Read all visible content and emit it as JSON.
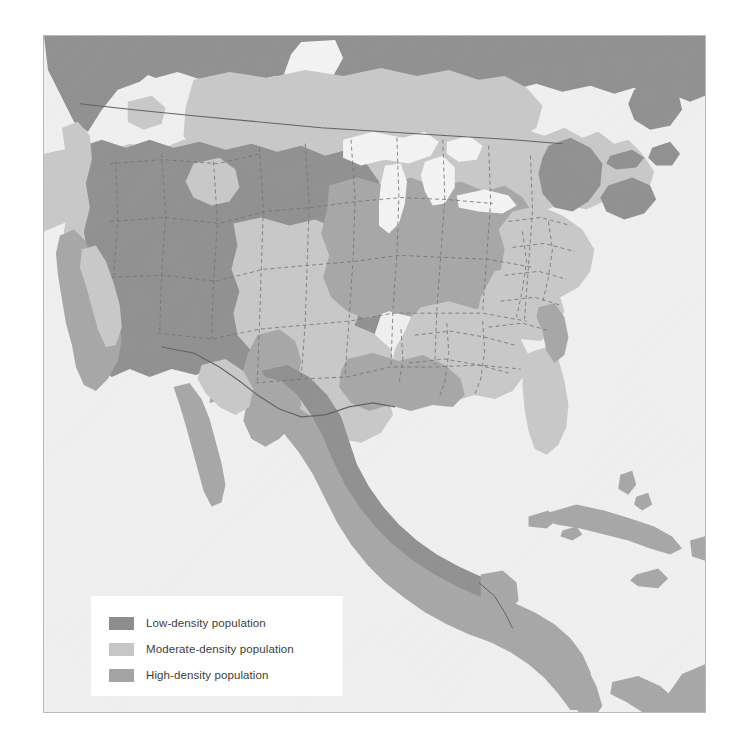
{
  "figure": {
    "kind": "choropleth-map",
    "region": "North America",
    "frame_background": "#eeeeee",
    "frame_border_color": "#b9b9b9",
    "page_background": "#ffffff"
  },
  "legend": {
    "background": "#ffffff",
    "items": [
      {
        "swatch_name": "swatch-low-density",
        "label": "Low-density population",
        "color": "#8d8d8d"
      },
      {
        "swatch_name": "swatch-moderate-density",
        "label": "Moderate-density population",
        "color": "#c6c6c6"
      },
      {
        "swatch_name": "swatch-high-density",
        "label": "High-density population",
        "color": "#a4a4a4"
      }
    ]
  },
  "map": {
    "ocean_color": "#eeeeee",
    "land_classes": {
      "low": "#8d8d8d",
      "moderate": "#c6c6c6",
      "high": "#a4a4a4",
      "water_inland": "#f2f2f2"
    },
    "boundary_styles": {
      "state_border_color": "#6f6f6f",
      "state_border_dash": "4,3",
      "national_border_color": "#5d5d5d"
    },
    "features": [
      {
        "name": "canada-north-boreal",
        "class": "low"
      },
      {
        "name": "canada-prairies",
        "class": "moderate"
      },
      {
        "name": "pacific-northwest",
        "class": "low"
      },
      {
        "name": "mountain-west",
        "class": "low"
      },
      {
        "name": "great-plains",
        "class": "moderate"
      },
      {
        "name": "midwest-great-lakes",
        "class": "high"
      },
      {
        "name": "northeast-corridor",
        "class": "moderate"
      },
      {
        "name": "maine-maritimes",
        "class": "low"
      },
      {
        "name": "southeast",
        "class": "moderate"
      },
      {
        "name": "gulf-coast",
        "class": "high"
      },
      {
        "name": "texas-interior",
        "class": "moderate"
      },
      {
        "name": "california-coast",
        "class": "high"
      },
      {
        "name": "mexico-highlands",
        "class": "low"
      },
      {
        "name": "mexico-coastal",
        "class": "high"
      },
      {
        "name": "central-america",
        "class": "high"
      },
      {
        "name": "caribbean-islands",
        "class": "high"
      },
      {
        "name": "great-lakes-water",
        "class": "water_inland"
      },
      {
        "name": "hudson-bay-water",
        "class": "water_inland"
      }
    ]
  }
}
